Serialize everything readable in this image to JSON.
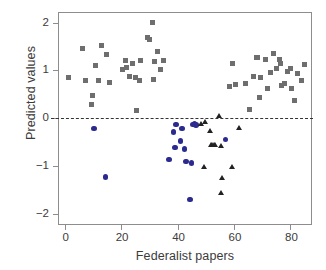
{
  "chart_data": {
    "type": "scatter",
    "title": "",
    "xlabel": "Federalist papers",
    "ylabel": "Predicted values",
    "xlim": [
      -2,
      88
    ],
    "ylim": [
      -2.25,
      2.2
    ],
    "xticks": [
      0,
      20,
      40,
      60,
      80
    ],
    "yticks": [
      2,
      1,
      0,
      -1,
      -2
    ],
    "ytick_labels": [
      "2",
      "1",
      "0",
      "−1",
      "−2"
    ],
    "xtick_labels": [
      "0",
      "20",
      "40",
      "60",
      "80"
    ],
    "grid": false,
    "legend": "none",
    "annotations": [
      {
        "name": "zero-reference-line",
        "type": "hline",
        "y": 0,
        "style": "dashed",
        "color": "#333333"
      }
    ],
    "colors": {
      "gray_square": "#6e6e6e",
      "blue_circle": "#2b2b8f",
      "black_triangle": "#222222",
      "axis": "#8d8d8d",
      "text": "#3b3b3b"
    },
    "series": [
      {
        "name": "gray-squares",
        "marker": "square",
        "color": "#6e6e6e",
        "points": [
          [
            1.5,
            0.85
          ],
          [
            6.5,
            1.45
          ],
          [
            7.5,
            0.79
          ],
          [
            9.5,
            0.28
          ],
          [
            10.0,
            0.47
          ],
          [
            11.0,
            1.1
          ],
          [
            12.0,
            0.78
          ],
          [
            13.0,
            1.52
          ],
          [
            15.0,
            1.34
          ],
          [
            16.0,
            0.75
          ],
          [
            20.5,
            1.03
          ],
          [
            21.5,
            1.2
          ],
          [
            22.0,
            1.07
          ],
          [
            23.0,
            0.88
          ],
          [
            24.0,
            1.15
          ],
          [
            25.0,
            0.85
          ],
          [
            25.5,
            0.17
          ],
          [
            26.5,
            0.8
          ],
          [
            27.0,
            1.2
          ],
          [
            29.5,
            1.68
          ],
          [
            30.0,
            1.64
          ],
          [
            31.0,
            2.01
          ],
          [
            31.5,
            0.82
          ],
          [
            32.0,
            1.18
          ],
          [
            33.0,
            1.4
          ],
          [
            34.0,
            1.02
          ],
          [
            35.0,
            1.2
          ],
          [
            58.5,
            0.67
          ],
          [
            59.5,
            1.15
          ],
          [
            60.5,
            0.7
          ],
          [
            64.0,
            0.72
          ],
          [
            65.5,
            0.19
          ],
          [
            67.0,
            0.88
          ],
          [
            68.0,
            1.26
          ],
          [
            68.5,
            1.28
          ],
          [
            69.0,
            0.44
          ],
          [
            69.5,
            0.85
          ],
          [
            71.0,
            1.22
          ],
          [
            72.0,
            0.63
          ],
          [
            73.0,
            0.95
          ],
          [
            74.0,
            1.35
          ],
          [
            75.0,
            1.04
          ],
          [
            76.0,
            1.22
          ],
          [
            76.5,
            1.14
          ],
          [
            77.0,
            0.68
          ],
          [
            78.0,
            0.72
          ],
          [
            79.0,
            0.98
          ],
          [
            80.0,
            1.04
          ],
          [
            80.5,
            0.63
          ],
          [
            81.5,
            0.38
          ],
          [
            82.5,
            0.93
          ],
          [
            84.0,
            0.8
          ],
          [
            85.0,
            1.13
          ]
        ]
      },
      {
        "name": "blue-circles",
        "marker": "circle",
        "color": "#2b2b8f",
        "points": [
          [
            10.5,
            -0.21
          ],
          [
            14.5,
            -1.23
          ],
          [
            37.0,
            -0.86
          ],
          [
            38.5,
            -0.28
          ],
          [
            39.0,
            -0.61
          ],
          [
            39.5,
            -0.13
          ],
          [
            41.0,
            -0.48
          ],
          [
            41.5,
            -0.21
          ],
          [
            42.5,
            -0.64
          ],
          [
            43.0,
            -0.9
          ],
          [
            44.5,
            -1.7
          ],
          [
            45.0,
            -0.93
          ],
          [
            45.5,
            -0.13
          ],
          [
            46.0,
            -0.12
          ],
          [
            46.5,
            -0.14
          ],
          [
            57.0,
            -0.44
          ]
        ]
      },
      {
        "name": "black-triangles",
        "marker": "triangle",
        "color": "#222222",
        "points": [
          [
            48.5,
            -0.14
          ],
          [
            49.5,
            -1.02
          ],
          [
            50.0,
            -0.1
          ],
          [
            51.5,
            -0.27
          ],
          [
            52.0,
            -0.57
          ],
          [
            52.5,
            -0.58
          ],
          [
            53.0,
            -0.57
          ],
          [
            53.5,
            -0.58
          ],
          [
            55.0,
            0.04
          ],
          [
            55.5,
            -0.59
          ],
          [
            56.0,
            -1.25
          ],
          [
            55.5,
            -1.58
          ],
          [
            59.5,
            -1.02
          ],
          [
            62.0,
            -0.22
          ]
        ]
      }
    ]
  }
}
